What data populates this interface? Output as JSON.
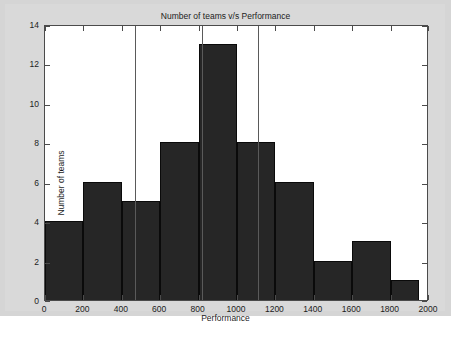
{
  "chart_data": {
    "type": "bar",
    "title": "Number of teams v/s Performance",
    "xlabel": "Performance",
    "ylabel": "Number of teams",
    "xlim": [
      0,
      2000
    ],
    "ylim": [
      0,
      14
    ],
    "xticks": [
      0,
      200,
      400,
      600,
      800,
      1000,
      1200,
      1400,
      1600,
      1800,
      2000
    ],
    "yticks": [
      0,
      2,
      4,
      6,
      8,
      10,
      12,
      14
    ],
    "grid": false,
    "legend": null,
    "bin_edges": [
      0,
      200,
      400,
      600,
      800,
      1000,
      1200,
      1400,
      1600,
      1800,
      1950
    ],
    "categories": [
      "0-200",
      "200-400",
      "400-600",
      "600-800",
      "800-1000",
      "1000-1200",
      "1200-1400",
      "1400-1600",
      "1600-1800",
      "1800-1950"
    ],
    "values": [
      4,
      6,
      5,
      8,
      13,
      8,
      6,
      2,
      3,
      1
    ],
    "bar_color": "#262626",
    "bar_edge_color": "#0a0a0a",
    "plot_background": "#ffffff",
    "figure_background": "#d5d5d5",
    "axis_color": "#4b4b4b",
    "reference_lines": {
      "color": "#5a5a5a",
      "x_values": [
        470,
        820,
        1110
      ]
    }
  }
}
